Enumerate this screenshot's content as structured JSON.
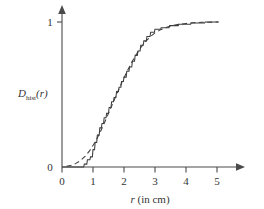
{
  "chart_data": {
    "type": "line",
    "title": "",
    "xlabel": "r (in cm)",
    "xlabel_italic_part": "r",
    "xlabel_rest": " (in cm)",
    "ylabel": "D_hist(r)",
    "ylabel_main": "D",
    "ylabel_subscript": "hist",
    "ylabel_arg": "(r)",
    "xlim": [
      0,
      5.6
    ],
    "ylim": [
      0,
      1.12
    ],
    "xticks": [
      0,
      1,
      2,
      3,
      4,
      5
    ],
    "xtick_labels": [
      "0",
      "1",
      "2",
      "3",
      "4",
      "5"
    ],
    "yticks": [
      0,
      1
    ],
    "ytick_labels": [
      "0",
      "1"
    ],
    "grid": false,
    "legend": "none",
    "axis_style": "arrowed-spines",
    "ink_color": "#3d3d3d",
    "background_color": "#ffffff",
    "series": [
      {
        "name": "empirical-cdf",
        "style": "solid-staircase",
        "description": "empirical cumulative distribution, step function",
        "points": [
          [
            0.0,
            0.0
          ],
          [
            0.7,
            0.0
          ],
          [
            0.72,
            0.02
          ],
          [
            0.8,
            0.02
          ],
          [
            0.82,
            0.05
          ],
          [
            0.9,
            0.05
          ],
          [
            0.92,
            0.07
          ],
          [
            0.98,
            0.07
          ],
          [
            1.0,
            0.12
          ],
          [
            1.05,
            0.12
          ],
          [
            1.07,
            0.17
          ],
          [
            1.12,
            0.17
          ],
          [
            1.14,
            0.22
          ],
          [
            1.2,
            0.22
          ],
          [
            1.22,
            0.27
          ],
          [
            1.27,
            0.27
          ],
          [
            1.29,
            0.3
          ],
          [
            1.34,
            0.3
          ],
          [
            1.36,
            0.34
          ],
          [
            1.42,
            0.34
          ],
          [
            1.44,
            0.37
          ],
          [
            1.5,
            0.37
          ],
          [
            1.52,
            0.41
          ],
          [
            1.58,
            0.41
          ],
          [
            1.6,
            0.45
          ],
          [
            1.66,
            0.45
          ],
          [
            1.68,
            0.48
          ],
          [
            1.74,
            0.48
          ],
          [
            1.76,
            0.52
          ],
          [
            1.82,
            0.52
          ],
          [
            1.84,
            0.55
          ],
          [
            1.9,
            0.55
          ],
          [
            1.92,
            0.59
          ],
          [
            1.98,
            0.59
          ],
          [
            2.0,
            0.62
          ],
          [
            2.07,
            0.62
          ],
          [
            2.09,
            0.66
          ],
          [
            2.16,
            0.66
          ],
          [
            2.18,
            0.69
          ],
          [
            2.25,
            0.69
          ],
          [
            2.27,
            0.73
          ],
          [
            2.34,
            0.73
          ],
          [
            2.36,
            0.77
          ],
          [
            2.43,
            0.77
          ],
          [
            2.45,
            0.8
          ],
          [
            2.52,
            0.8
          ],
          [
            2.54,
            0.84
          ],
          [
            2.62,
            0.84
          ],
          [
            2.64,
            0.87
          ],
          [
            2.72,
            0.87
          ],
          [
            2.74,
            0.9
          ],
          [
            2.84,
            0.9
          ],
          [
            2.86,
            0.93
          ],
          [
            2.98,
            0.93
          ],
          [
            3.0,
            0.95
          ],
          [
            3.18,
            0.95
          ],
          [
            3.2,
            0.96
          ],
          [
            3.45,
            0.96
          ],
          [
            3.47,
            0.975
          ],
          [
            3.75,
            0.975
          ],
          [
            3.77,
            0.985
          ],
          [
            4.15,
            0.985
          ],
          [
            4.17,
            0.993
          ],
          [
            4.6,
            0.993
          ],
          [
            4.62,
            1.0
          ],
          [
            5.05,
            1.0
          ]
        ]
      },
      {
        "name": "theoretical-cdf",
        "style": "dashed-smooth",
        "description": "fitted smooth cumulative distribution curve",
        "points": [
          [
            0.15,
            0.005
          ],
          [
            0.3,
            0.012
          ],
          [
            0.45,
            0.025
          ],
          [
            0.6,
            0.045
          ],
          [
            0.75,
            0.075
          ],
          [
            0.9,
            0.115
          ],
          [
            1.05,
            0.165
          ],
          [
            1.2,
            0.225
          ],
          [
            1.35,
            0.295
          ],
          [
            1.5,
            0.37
          ],
          [
            1.65,
            0.445
          ],
          [
            1.8,
            0.52
          ],
          [
            1.95,
            0.592
          ],
          [
            2.1,
            0.66
          ],
          [
            2.25,
            0.722
          ],
          [
            2.4,
            0.778
          ],
          [
            2.55,
            0.826
          ],
          [
            2.7,
            0.866
          ],
          [
            2.85,
            0.899
          ],
          [
            3.0,
            0.925
          ],
          [
            3.2,
            0.949
          ],
          [
            3.4,
            0.965
          ],
          [
            3.6,
            0.977
          ],
          [
            3.8,
            0.985
          ],
          [
            4.0,
            0.99
          ],
          [
            4.25,
            0.995
          ],
          [
            4.5,
            0.998
          ],
          [
            4.75,
            0.999
          ],
          [
            5.05,
            1.0
          ]
        ]
      }
    ]
  },
  "figure": {
    "caption": ""
  }
}
